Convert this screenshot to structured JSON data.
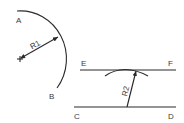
{
  "diagram": {
    "type": "geometric-construction",
    "left_figure": {
      "description": "Arc AB drawn with radius R1 from a marked center point",
      "point_labels": {
        "start": "A",
        "end": "B"
      },
      "radius_label": "R1",
      "center_marker": "cross-mark"
    },
    "right_figure": {
      "description": "Line EF drawn parallel to line CD at distance R2 using an arc",
      "upper_line": {
        "start_label": "E",
        "end_label": "F"
      },
      "lower_line": {
        "start_label": "C",
        "end_label": "D"
      },
      "radius_label": "R2"
    }
  }
}
